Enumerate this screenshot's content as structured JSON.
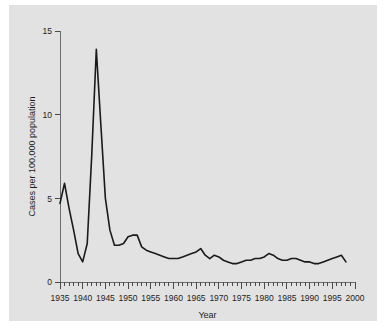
{
  "chart_data": {
    "type": "line",
    "title": "",
    "xlabel": "Year",
    "ylabel": "Cases per 100,000 population",
    "xlim": [
      1935,
      2000
    ],
    "ylim": [
      0,
      15
    ],
    "grid": false,
    "legend": null,
    "x_major_ticks": [
      1935,
      1940,
      1945,
      1950,
      1955,
      1960,
      1965,
      1970,
      1975,
      1980,
      1985,
      1990,
      1995,
      2000
    ],
    "x_major_tick_labels": [
      "1935",
      "1940",
      "1945",
      "1950",
      "1955",
      "1960",
      "1965",
      "1970",
      "1975",
      "1980",
      "1985",
      "1990",
      "1995",
      "2000"
    ],
    "x_minor_tick_interval": 1,
    "y_ticks": [
      0,
      5,
      10,
      15
    ],
    "y_tick_labels": [
      "0",
      "5",
      "10",
      "15"
    ],
    "series": [
      {
        "name": "Cases per 100,000 population",
        "color": "#1a1a1a",
        "x": [
          1935,
          1936,
          1937,
          1938,
          1939,
          1940,
          1941,
          1942,
          1943,
          1944,
          1945,
          1946,
          1947,
          1948,
          1949,
          1950,
          1951,
          1952,
          1953,
          1954,
          1955,
          1956,
          1957,
          1958,
          1959,
          1960,
          1961,
          1962,
          1963,
          1964,
          1965,
          1966,
          1967,
          1968,
          1969,
          1970,
          1971,
          1972,
          1973,
          1974,
          1975,
          1976,
          1977,
          1978,
          1979,
          1980,
          1981,
          1982,
          1983,
          1984,
          1985,
          1986,
          1987,
          1988,
          1989,
          1990,
          1991,
          1992,
          1993,
          1994,
          1995,
          1996,
          1997,
          1998
        ],
        "y": [
          4.7,
          5.9,
          4.4,
          3.1,
          1.7,
          1.2,
          2.3,
          7.6,
          13.9,
          9.4,
          5.0,
          3.1,
          2.2,
          2.2,
          2.3,
          2.7,
          2.8,
          2.8,
          2.1,
          1.9,
          1.8,
          1.7,
          1.6,
          1.5,
          1.4,
          1.4,
          1.4,
          1.5,
          1.6,
          1.7,
          1.8,
          2.0,
          1.6,
          1.4,
          1.6,
          1.5,
          1.3,
          1.2,
          1.1,
          1.1,
          1.2,
          1.3,
          1.3,
          1.4,
          1.4,
          1.5,
          1.7,
          1.6,
          1.4,
          1.3,
          1.3,
          1.4,
          1.4,
          1.3,
          1.2,
          1.2,
          1.1,
          1.1,
          1.2,
          1.3,
          1.4,
          1.5,
          1.6,
          1.2
        ]
      }
    ]
  }
}
